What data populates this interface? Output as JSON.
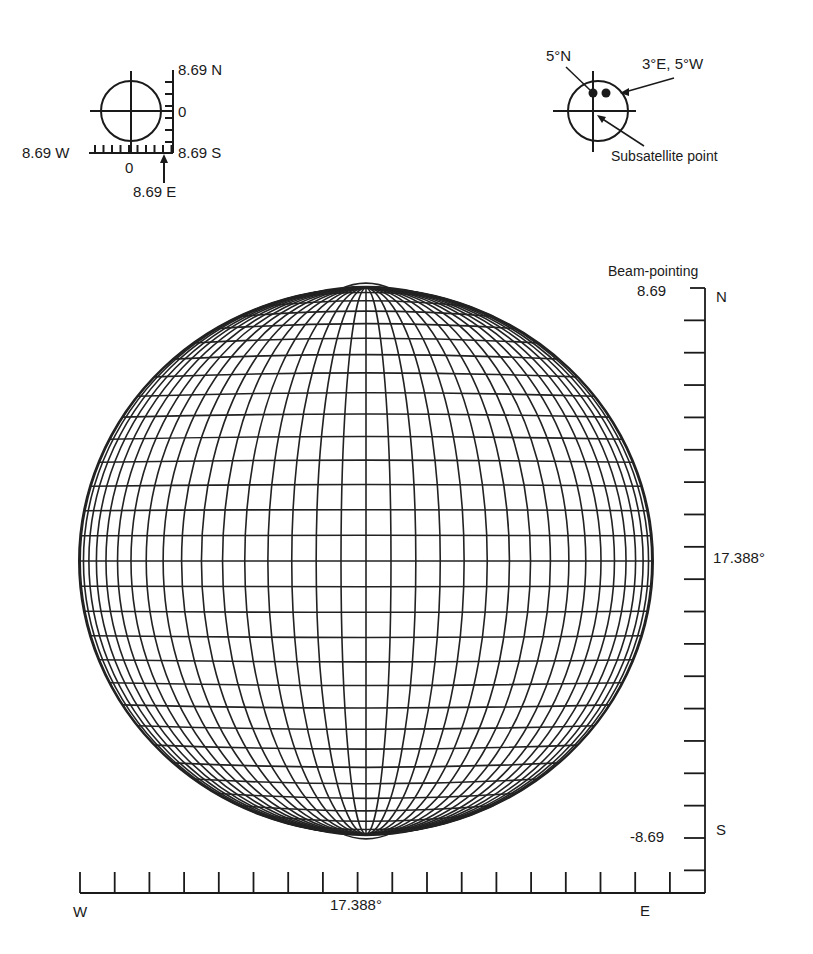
{
  "inset_left": {
    "top_label": "8.69 N",
    "mid_label": "0",
    "bottom_right_label": "8.69 S",
    "left_label": "8.69 W",
    "zero_label": "0",
    "east_label": "8.69 E"
  },
  "inset_right": {
    "north_label": "5°N",
    "ew_label": "3°E, 5°W",
    "subsatellite_label": "Subsatellite point"
  },
  "main": {
    "title": "Beam-pointing",
    "right_axis": {
      "top_value": "8.69",
      "top_dir": "N",
      "mid_value": "17.388°",
      "bottom_value": "-8.69",
      "bottom_dir": "S",
      "tick_count": 19
    },
    "bottom_axis": {
      "left_dir": "W",
      "mid_value": "17.388°",
      "right_dir": "E",
      "tick_count": 18
    },
    "globe": {
      "meridian_step_deg": 5,
      "parallel_step_deg": 5.3,
      "line_color": "#222222"
    }
  }
}
